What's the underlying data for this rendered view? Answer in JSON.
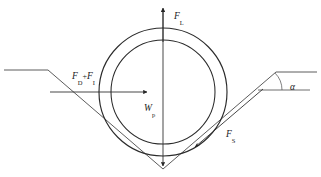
{
  "figure": {
    "background_color": "#ffffff",
    "line_color": "#3c3c3c",
    "stroke_color_strong": "#262626",
    "width": 321,
    "height": 177
  },
  "labels": {
    "lift_force": {
      "symbol": "F",
      "subscript": "L"
    },
    "drag_force": {
      "symbol": "F",
      "subscript": "D"
    },
    "plus": "+",
    "inertia_force": {
      "symbol": "F",
      "subscript": "I"
    },
    "weight": {
      "symbol": "W",
      "subscript": "p"
    },
    "soil_force": {
      "symbol": "F",
      "subscript": "S"
    },
    "angle": "α"
  },
  "geometry": {
    "pipe_center": {
      "x": 163,
      "y": 92
    },
    "outer_radius": 64,
    "inner_radius": 52,
    "trench_vertex": {
      "x": 163,
      "y": 169
    },
    "left_ground_y": 70,
    "right_ground_y": 72,
    "left_shoulder_x": 48,
    "right_shoulder_x": 276,
    "slope_angle_deg": 45
  },
  "arrows": {
    "lift": {
      "from": {
        "x": 163,
        "y": 40
      },
      "to": {
        "x": 163,
        "y": 9
      },
      "direction": "up"
    },
    "weight": {
      "from": {
        "x": 163,
        "y": 92
      },
      "to": {
        "x": 163,
        "y": 167
      },
      "direction": "down"
    },
    "drag_inertia": {
      "from": {
        "x": 50,
        "y": 92
      },
      "to": {
        "x": 148,
        "y": 92
      },
      "direction": "right"
    },
    "soil": {
      "from": {
        "x": 262,
        "y": 90
      },
      "to": {
        "x": 194,
        "y": 147
      },
      "direction": "down-left"
    }
  }
}
